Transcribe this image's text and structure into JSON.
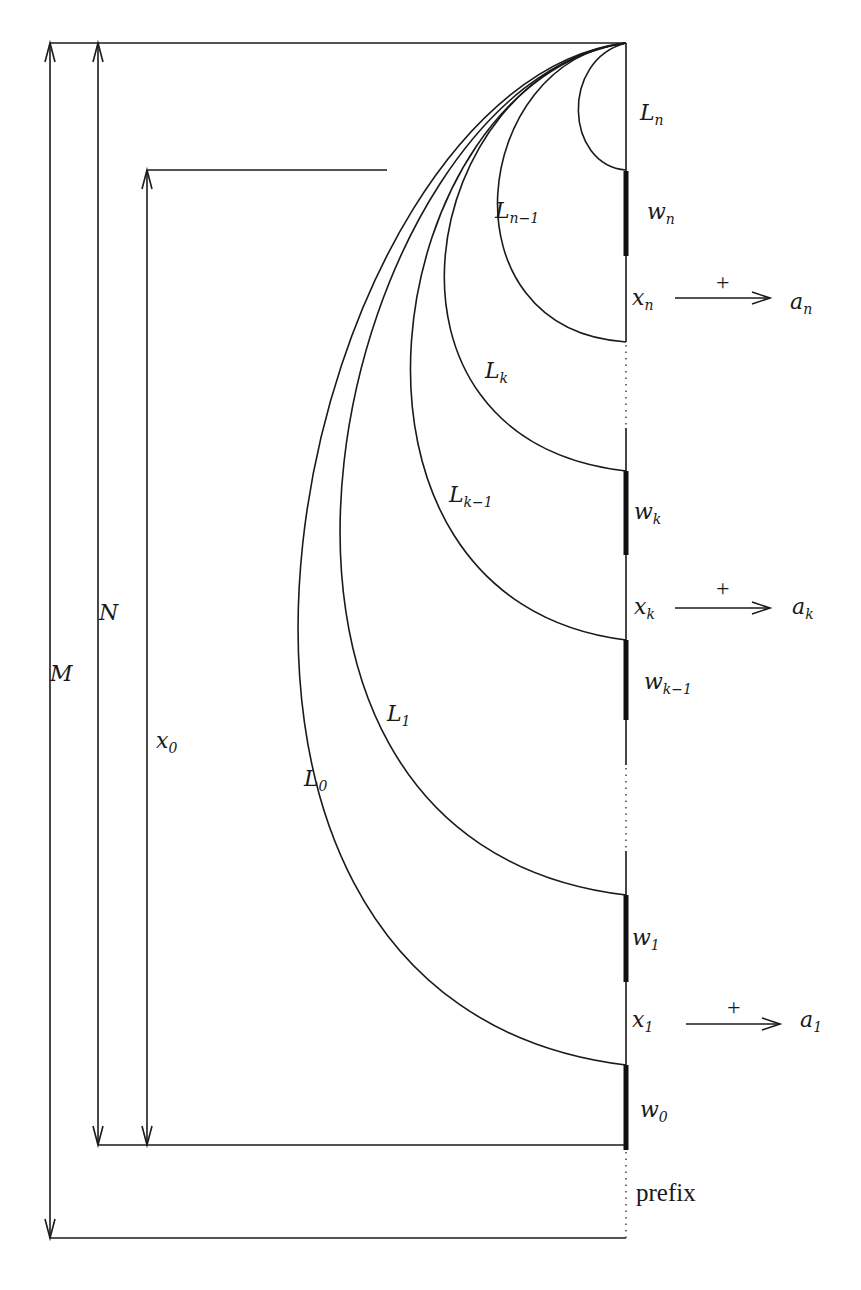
{
  "labels": {
    "M": "M",
    "N": "N",
    "x0": {
      "base": "x",
      "sub": "0"
    },
    "Ln": {
      "base": "L",
      "sub": "n"
    },
    "Ln1": {
      "base": "L",
      "sub": "n−1"
    },
    "Lk": {
      "base": "L",
      "sub": "k"
    },
    "Lk1": {
      "base": "L",
      "sub": "k−1"
    },
    "L1": {
      "base": "L",
      "sub": "1"
    },
    "L0": {
      "base": "L",
      "sub": "0"
    },
    "wn": {
      "base": "w",
      "sub": "n"
    },
    "wk": {
      "base": "w",
      "sub": "k"
    },
    "wk1": {
      "base": "w",
      "sub": "k−1"
    },
    "w1": {
      "base": "w",
      "sub": "1"
    },
    "w0": {
      "base": "w",
      "sub": "0"
    },
    "xn": {
      "base": "x",
      "sub": "n"
    },
    "xk": {
      "base": "x",
      "sub": "k"
    },
    "x1": {
      "base": "x",
      "sub": "1"
    },
    "an": {
      "base": "a",
      "sub": "n"
    },
    "ak": {
      "base": "a",
      "sub": "k"
    },
    "a1": {
      "base": "a",
      "sub": "1"
    },
    "plus": "+",
    "prefix": "prefix"
  },
  "colors": {
    "stroke": "#1a1a1a",
    "background": "#ffffff"
  }
}
